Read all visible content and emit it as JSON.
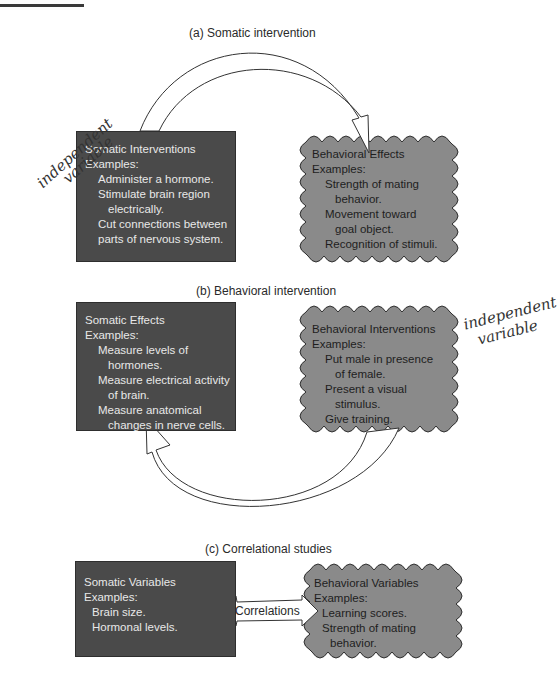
{
  "panels": {
    "a": {
      "caption": "(a) Somatic intervention",
      "left_box": {
        "title": "Somatic Interventions",
        "examples_label": "Examples:",
        "lines": [
          {
            "text": "Administer a hormone.",
            "indent": 1
          },
          {
            "text": "Stimulate brain region",
            "indent": 1
          },
          {
            "text": "electrically.",
            "indent": 2
          },
          {
            "text": "Cut connections between",
            "indent": 1
          },
          {
            "text": "parts of nervous system.",
            "indent": 1
          }
        ]
      },
      "right_box": {
        "title": "Behavioral Effects",
        "examples_label": "Examples:",
        "lines": [
          {
            "text": "Strength of mating",
            "indent": 1
          },
          {
            "text": "behavior.",
            "indent": 2
          },
          {
            "text": "Movement toward",
            "indent": 1
          },
          {
            "text": "goal object.",
            "indent": 2
          },
          {
            "text": "Recognition of stimuli.",
            "indent": 1
          }
        ]
      },
      "annotation": "independent variable",
      "annotation_lines": [
        "independent",
        "variable"
      ],
      "arrow_direction": "left-to-right"
    },
    "b": {
      "caption": "(b) Behavioral intervention",
      "left_box": {
        "title": "Somatic Effects",
        "examples_label": "Examples:",
        "lines": [
          {
            "text": "Measure levels of",
            "indent": 1
          },
          {
            "text": "hormones.",
            "indent": 2
          },
          {
            "text": "Measure electrical activity",
            "indent": 1
          },
          {
            "text": "of brain.",
            "indent": 2
          },
          {
            "text": "Measure anatomical",
            "indent": 1
          },
          {
            "text": "changes in nerve cells.",
            "indent": 2
          }
        ]
      },
      "right_box": {
        "title": "Behavioral Interventions",
        "examples_label": "Examples:",
        "lines": [
          {
            "text": "Put male in presence",
            "indent": 1
          },
          {
            "text": "of female.",
            "indent": 2
          },
          {
            "text": "Present a visual",
            "indent": 1
          },
          {
            "text": "stimulus.",
            "indent": 2
          },
          {
            "text": "Give training.",
            "indent": 1
          }
        ]
      },
      "annotation": "independent variable",
      "annotation_lines": [
        "independent",
        "variable"
      ],
      "arrow_direction": "right-to-left"
    },
    "c": {
      "caption": "(c) Correlational studies",
      "left_box": {
        "title": "Somatic Variables",
        "examples_label": "Examples:",
        "lines": [
          {
            "text": "Brain size.",
            "indent": 1
          },
          {
            "text": "Hormonal levels.",
            "indent": 1
          }
        ]
      },
      "right_box": {
        "title": "Behavioral Variables",
        "examples_label": "Examples:",
        "lines": [
          {
            "text": "Learning scores.",
            "indent": 1
          },
          {
            "text": "Strength of mating",
            "indent": 1
          },
          {
            "text": "behavior.",
            "indent": 2
          }
        ]
      },
      "connector_label": "Correlations",
      "arrow_direction": "bidirectional"
    }
  },
  "colors": {
    "somatic_box_fill": "#4a4a4a",
    "behavioral_box_fill": "#8a8a8a",
    "somatic_text": "#e8e8e8",
    "behavioral_text": "#1e1e1e",
    "arrow_fill": "#ffffff",
    "arrow_stroke": "#333333"
  }
}
